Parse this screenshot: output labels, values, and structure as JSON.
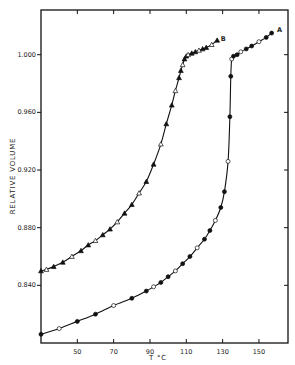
{
  "chart_data": {
    "type": "line",
    "title": "",
    "xlabel": "T °C",
    "ylabel": "RELATIVE VOLUME",
    "xlim": [
      30,
      166
    ],
    "ylim": [
      0.8,
      1.031
    ],
    "xticks": [
      50,
      70,
      90,
      110,
      130,
      150
    ],
    "yticks": [
      0.84,
      0.88,
      0.92,
      0.96,
      1.0
    ],
    "ytick_labels": [
      "0.840",
      "0.880",
      "0.920",
      "0.960",
      "1.000"
    ],
    "grid": false,
    "legend": "curve labels at line ends",
    "series": [
      {
        "name": "B",
        "marker": "triangle",
        "x": [
          30,
          33,
          37,
          42,
          47,
          52,
          56,
          60,
          64,
          68,
          72,
          76,
          80,
          84,
          88,
          92,
          96,
          99,
          102,
          104,
          106,
          107,
          108,
          109,
          110,
          111,
          113,
          115,
          117,
          119,
          121,
          124,
          127
        ],
        "values": [
          0.85,
          0.851,
          0.853,
          0.856,
          0.86,
          0.864,
          0.868,
          0.871,
          0.875,
          0.879,
          0.884,
          0.89,
          0.896,
          0.904,
          0.912,
          0.924,
          0.938,
          0.952,
          0.965,
          0.975,
          0.984,
          0.989,
          0.993,
          0.997,
          0.999,
          1.0,
          1.001,
          1.002,
          1.003,
          1.004,
          1.005,
          1.007,
          1.01
        ]
      },
      {
        "name": "A",
        "marker": "circle",
        "x": [
          30,
          40,
          50,
          60,
          70,
          80,
          88,
          92,
          96,
          100,
          104,
          108,
          112,
          116,
          120,
          123,
          126,
          129,
          131,
          133,
          134,
          134.5,
          135,
          136,
          138,
          140,
          143,
          146,
          150,
          154,
          157
        ],
        "values": [
          0.806,
          0.81,
          0.815,
          0.82,
          0.826,
          0.831,
          0.836,
          0.839,
          0.842,
          0.846,
          0.85,
          0.855,
          0.86,
          0.866,
          0.872,
          0.878,
          0.885,
          0.894,
          0.905,
          0.926,
          0.957,
          0.985,
          0.997,
          0.999,
          1.0,
          1.002,
          1.004,
          1.006,
          1.009,
          1.012,
          1.015
        ]
      }
    ],
    "annotations": [
      {
        "text": "B",
        "x": 129,
        "y": 1.011
      },
      {
        "text": "A",
        "x": 160,
        "y": 1.017
      }
    ]
  }
}
